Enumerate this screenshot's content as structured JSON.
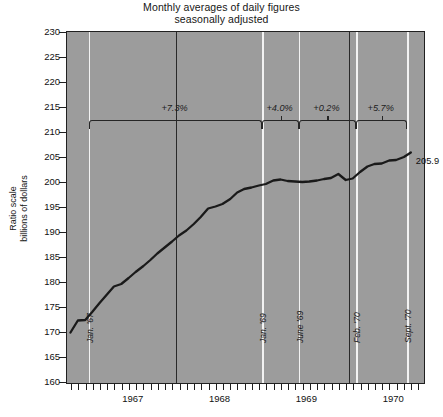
{
  "chart_data": {
    "type": "line",
    "title": "Monthly averages of daily figures",
    "subtitle": "seasonally adjusted",
    "ylabel_line1": "Ratio scale",
    "ylabel_line2": "billions of dollars",
    "xlabel": "",
    "ylim": [
      160,
      230
    ],
    "ytick_step": 5,
    "yticks": [
      160,
      165,
      170,
      175,
      180,
      185,
      190,
      195,
      200,
      205,
      210,
      215,
      220,
      225,
      230
    ],
    "ytick_labels": [
      "160",
      "165",
      "170",
      "175",
      "180",
      "185",
      "190",
      "195",
      "200",
      "205",
      "210",
      "215",
      "220",
      "225",
      "230"
    ],
    "xlim": [
      1966.75,
      1970.85
    ],
    "xtick_labels": [
      "1967",
      "1968",
      "1969",
      "1970"
    ],
    "xtick_values": [
      1967.5,
      1968.5,
      1969.5,
      1970.5
    ],
    "year_gridlines": [
      1968.0,
      1969.0,
      1970.0
    ],
    "grid": true,
    "legend": "none",
    "series": [
      {
        "name": "Money stock",
        "x": [
          1966.79,
          1966.875,
          1966.96,
          1967.04,
          1967.125,
          1967.21,
          1967.29,
          1967.375,
          1967.46,
          1967.54,
          1967.63,
          1967.71,
          1967.79,
          1967.875,
          1967.96,
          1968.04,
          1968.125,
          1968.21,
          1968.29,
          1968.375,
          1968.46,
          1968.54,
          1968.63,
          1968.71,
          1968.79,
          1968.875,
          1968.96,
          1969.04,
          1969.125,
          1969.21,
          1969.29,
          1969.375,
          1969.46,
          1969.54,
          1969.63,
          1969.71,
          1969.79,
          1969.875,
          1969.96,
          1970.04,
          1970.125,
          1970.21,
          1970.29,
          1970.375,
          1970.46,
          1970.54,
          1970.63,
          1970.71
        ],
        "values": [
          169.9,
          172.3,
          172.4,
          174.0,
          175.8,
          177.5,
          179.1,
          179.6,
          180.8,
          182.0,
          183.2,
          184.4,
          185.7,
          186.9,
          188.1,
          189.3,
          190.3,
          191.6,
          193.0,
          194.7,
          195.1,
          195.6,
          196.6,
          197.9,
          198.6,
          198.9,
          199.3,
          199.6,
          200.3,
          200.5,
          200.2,
          200.1,
          200.0,
          200.1,
          200.3,
          200.6,
          200.8,
          201.6,
          200.4,
          200.7,
          202.0,
          203.1,
          203.6,
          203.7,
          204.3,
          204.4,
          205.0,
          205.9
        ],
        "color": "#1a1a1a",
        "linewidth": 2.3
      }
    ],
    "end_value_label": "205.9",
    "event_lines": [
      {
        "label": "Jan. '67",
        "x": 1967.0
      },
      {
        "label": "Jan. '69",
        "x": 1969.0
      },
      {
        "label": "June '69",
        "x": 1969.42
      },
      {
        "label": "Feb. '70",
        "x": 1970.08
      },
      {
        "label": "Sept. '70",
        "x": 1970.67
      }
    ],
    "annotations": [
      {
        "label": "+7.3%",
        "from": 1967.0,
        "to": 1969.0
      },
      {
        "label": "+4.0%",
        "from": 1969.0,
        "to": 1969.42
      },
      {
        "label": "+0.2%",
        "from": 1969.42,
        "to": 1970.08
      },
      {
        "label": "+5.7%",
        "from": 1970.08,
        "to": 1970.67
      }
    ],
    "annotation_baseline_y": 212.4,
    "source_note": ""
  },
  "colors": {
    "plot_background": "#9c9c9c",
    "page_background": "#ffffff",
    "line": "#1a1a1a",
    "axis": "#202020",
    "event_line": "#f2f2f2",
    "year_gridline": "#2a2a2a"
  }
}
